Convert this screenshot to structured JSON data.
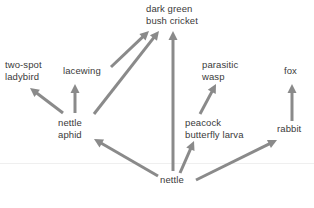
{
  "diagram": {
    "background_color": "#ffffff",
    "arrow_color": "#8a8a8a",
    "text_color": "#3a3a3a",
    "nodes": [
      {
        "id": "two-spot-ladybird",
        "label": "two-spot\nladybird",
        "x": 5,
        "y": 59,
        "w": 52,
        "align": "left"
      },
      {
        "id": "lacewing",
        "label": "lacewing",
        "x": 63,
        "y": 65,
        "w": 48,
        "align": "left"
      },
      {
        "id": "dark-green-bush-cricket",
        "label": "dark green\nbush cricket",
        "x": 146,
        "y": 3,
        "w": 62,
        "align": "left"
      },
      {
        "id": "parasitic-wasp",
        "label": "parasitic\nwasp",
        "x": 202,
        "y": 59,
        "w": 40,
        "align": "left"
      },
      {
        "id": "fox",
        "label": "fox",
        "x": 284,
        "y": 65,
        "w": 22,
        "align": "left"
      },
      {
        "id": "nettle-aphid",
        "label": "nettle\naphid",
        "x": 58,
        "y": 117,
        "w": 34,
        "align": "left"
      },
      {
        "id": "peacock-butterfly-larva",
        "label": "peacock\nbutterfly larva",
        "x": 185,
        "y": 117,
        "w": 66,
        "align": "left"
      },
      {
        "id": "rabbit",
        "label": "rabbit",
        "x": 277,
        "y": 123,
        "w": 32,
        "align": "left"
      },
      {
        "id": "nettle",
        "label": "nettle",
        "x": 160,
        "y": 174,
        "w": 32,
        "align": "left"
      }
    ],
    "edges": [
      {
        "id": "nettle-aphid-to-two-spot-ladybird",
        "from": "nettle aphid",
        "to": "two-spot ladybird",
        "x1": 63,
        "y1": 113,
        "x2": 30,
        "y2": 88
      },
      {
        "id": "nettle-aphid-to-lacewing",
        "from": "nettle aphid",
        "to": "lacewing",
        "x1": 75,
        "y1": 113,
        "x2": 75,
        "y2": 84
      },
      {
        "id": "nettle-aphid-to-dark-green-bush-cricket",
        "from": "nettle aphid",
        "to": "dark green bush cricket",
        "x1": 94,
        "y1": 114,
        "x2": 159,
        "y2": 31
      },
      {
        "id": "lacewing-to-dark-green-bush-cricket",
        "from": "lacewing",
        "to": "dark green bush cricket",
        "x1": 111,
        "y1": 67,
        "x2": 149,
        "y2": 31
      },
      {
        "id": "nettle-to-dark-green-bush-cricket",
        "from": "nettle",
        "to": "dark green bush cricket",
        "x1": 173,
        "y1": 171,
        "x2": 173,
        "y2": 31
      },
      {
        "id": "peacock-butterfly-larva-to-parasitic-wasp",
        "from": "peacock butterfly larva",
        "to": "parasitic wasp",
        "x1": 200,
        "y1": 114,
        "x2": 216,
        "y2": 84
      },
      {
        "id": "rabbit-to-fox",
        "from": "rabbit",
        "to": "fox",
        "x1": 292,
        "y1": 121,
        "x2": 292,
        "y2": 84
      },
      {
        "id": "nettle-to-nettle-aphid",
        "from": "nettle",
        "to": "nettle aphid",
        "x1": 158,
        "y1": 176,
        "x2": 94,
        "y2": 139
      },
      {
        "id": "nettle-to-peacock-butterfly-larva",
        "from": "nettle",
        "to": "peacock butterfly larva",
        "x1": 180,
        "y1": 173,
        "x2": 194,
        "y2": 141
      },
      {
        "id": "nettle-to-rabbit",
        "from": "nettle",
        "to": "rabbit",
        "x1": 196,
        "y1": 180,
        "x2": 277,
        "y2": 140
      }
    ],
    "rule": {
      "id": "faint-horizontal-rule",
      "x": 0,
      "y": 163,
      "w": 314,
      "color": "#efefef"
    }
  }
}
